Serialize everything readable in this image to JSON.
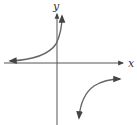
{
  "figure": {
    "type": "function-graph",
    "axes": {
      "x_label": "x",
      "y_label": "y"
    },
    "branches": [
      {
        "name": "upper-left-branch",
        "left_end": "approaches x-axis from above (arrow left)",
        "right_end": "rises toward +infinity (arrow up)"
      },
      {
        "name": "lower-right-branch",
        "left_end": "falls toward -infinity (arrow down)",
        "right_end": "approaches horizontal asymptote (arrow right)"
      }
    ],
    "colors": {
      "axis": "#555555",
      "curve": "#666666",
      "background": "#ffffff"
    }
  }
}
